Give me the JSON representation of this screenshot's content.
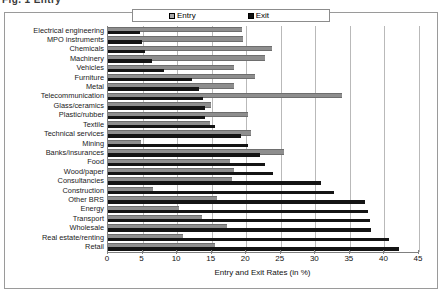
{
  "caption": {
    "text": "Fig. 1  Entry"
  },
  "legend": {
    "entry_label": "Entry",
    "exit_label": "Exit",
    "entry_color": "#8e8e8e",
    "exit_color": "#141414"
  },
  "chart_data": {
    "type": "bar",
    "orientation": "horizontal",
    "title": "",
    "xlabel": "Entry and Exit Rates (in %)",
    "ylabel": "",
    "xlim": [
      0,
      45
    ],
    "xticks": [
      0,
      5,
      10,
      15,
      20,
      25,
      30,
      35,
      40,
      45
    ],
    "grid": "vertical",
    "legend_position": "top-center",
    "categories": [
      "Electrical  engineering",
      "MPO instruments",
      "Chemicals",
      "Machinery",
      "Vehicles",
      "Furniture",
      "Metal",
      "Telecommunication",
      "Glass/ceramics",
      "Plastic/rubber",
      "Textile",
      "Technical services",
      "Mining",
      "Banks/insurances",
      "Food",
      "Wood/paper",
      "Consultancies",
      "Construction",
      "Other BRS",
      "Energy",
      "Transport",
      "Wholesale",
      "Real estate/renting",
      "Retail"
    ],
    "series": [
      {
        "name": "Entry",
        "color": "#8e8e8e",
        "values": [
          19.4,
          19.5,
          23.8,
          22.7,
          18.2,
          21.2,
          18.3,
          33.9,
          14.9,
          20.3,
          14.7,
          20.7,
          4.8,
          25.5,
          17.6,
          18.2,
          18.0,
          6.5,
          15.7,
          10.3,
          13.6,
          17.2,
          10.8,
          15.5
        ]
      },
      {
        "name": "Exit",
        "color": "#141414",
        "values": [
          4.6,
          4.9,
          5.4,
          6.4,
          8.1,
          12.2,
          13.1,
          13.8,
          14.1,
          14.0,
          15.5,
          19.2,
          20.2,
          22.0,
          22.7,
          23.9,
          30.8,
          32.7,
          37.2,
          37.6,
          37.9,
          38.0,
          40.7,
          42.1
        ]
      }
    ]
  }
}
